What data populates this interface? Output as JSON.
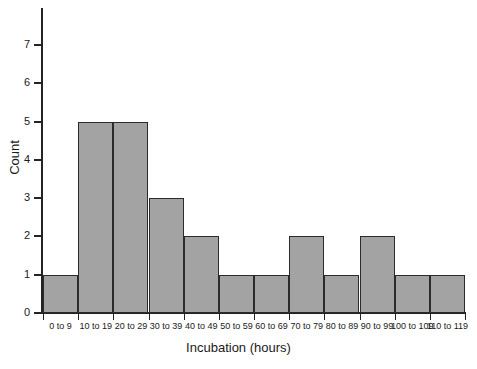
{
  "chart_data": {
    "type": "bar",
    "title": "",
    "subtitle": "",
    "xlabel": "Incubation (hours)",
    "ylabel": "Count",
    "categories": [
      "0 to 9",
      "10 to 19",
      "20 to 29",
      "30 to 39",
      "40 to 49",
      "50 to 59",
      "60 to 69",
      "70 to 79",
      "80 to 89",
      "90 to 99",
      "100 to 109",
      "110 to 119"
    ],
    "values": [
      1,
      5,
      5,
      3,
      2,
      1,
      1,
      2,
      1,
      2,
      1,
      1
    ],
    "ylim": [
      0,
      7
    ],
    "ytick_labels": [
      "0",
      "1",
      "2",
      "3",
      "4",
      "5",
      "6",
      "7"
    ],
    "ytick_values": [
      0,
      1,
      2,
      3,
      4,
      5,
      6,
      7
    ],
    "grid": false,
    "legend": null,
    "legend_position": "none",
    "bar_fill_color": "#a3a3a3",
    "bar_edge_color": "#2b2b2b",
    "axis_color": "#242424",
    "background_color": "#ffffff",
    "bars_adjacent": true,
    "total_count": 25
  }
}
